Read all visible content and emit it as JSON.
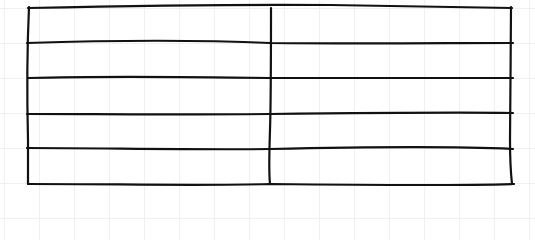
{
  "diagram": {
    "type": "hand-drawn-table",
    "rows": 5,
    "columns": 2,
    "stroke_color": "#111111",
    "background_color": "#ffffff",
    "grid_color": "#eef0f2",
    "cells": [
      [
        "",
        ""
      ],
      [
        "",
        ""
      ],
      [
        "",
        ""
      ],
      [
        "",
        ""
      ],
      [
        "",
        ""
      ]
    ]
  }
}
